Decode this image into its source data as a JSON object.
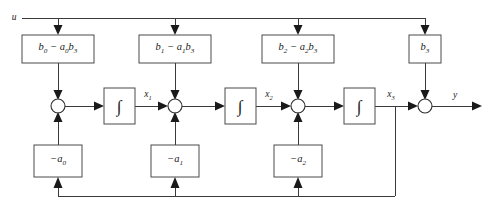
{
  "diagram": {
    "input_label": "u",
    "output_label": "y",
    "colors": {
      "wire": "#3a3a3a",
      "block_border": "#4a4a4a",
      "text": "#1a1a1a",
      "background": "#ffffff"
    },
    "feedforward_blocks": [
      {
        "id": "b0",
        "label_html": "b<sub>0</sub> − a<sub>0</sub>b<sub>3</sub>",
        "plain": "b0 - a0*b3"
      },
      {
        "id": "b1",
        "label_html": "b<sub>1</sub> − a<sub>1</sub>b<sub>3</sub>",
        "plain": "b1 - a1*b3"
      },
      {
        "id": "b2",
        "label_html": "b<sub>2</sub> − a<sub>2</sub>b<sub>3</sub>",
        "plain": "b2 - a2*b3"
      },
      {
        "id": "b3",
        "label_html": "b<sub>3</sub>",
        "plain": "b3"
      }
    ],
    "feedback_blocks": [
      {
        "id": "a0",
        "label_html": "−a<sub>0</sub>",
        "plain": "-a0"
      },
      {
        "id": "a1",
        "label_html": "−a<sub>1</sub>",
        "plain": "-a1"
      },
      {
        "id": "a2",
        "label_html": "−a<sub>2</sub>",
        "plain": "-a2"
      }
    ],
    "integrators": [
      {
        "id": "int1",
        "symbol": "∫",
        "output_label_html": "x<sub>1</sub>",
        "output_plain": "x1"
      },
      {
        "id": "int2",
        "symbol": "∫",
        "output_label_html": "x<sub>2</sub>",
        "output_plain": "x2"
      },
      {
        "id": "int3",
        "symbol": "∫",
        "output_label_html": "x<sub>3</sub>",
        "output_plain": "x3"
      }
    ],
    "summing_junctions": [
      {
        "id": "sum1"
      },
      {
        "id": "sum2"
      },
      {
        "id": "sum3"
      },
      {
        "id": "sum4"
      }
    ],
    "state_labels": [
      "x1",
      "x2",
      "x3"
    ]
  }
}
